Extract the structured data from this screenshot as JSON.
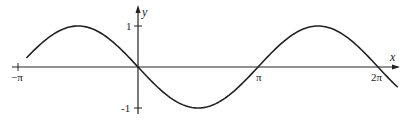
{
  "chart_data": {
    "type": "line",
    "title": "",
    "function": "y = -sin(x)",
    "xlabel": "x",
    "ylabel": "y",
    "x_ticks": [
      {
        "value": -3.14159,
        "label": "−π"
      },
      {
        "value": 3.14159,
        "label": "π"
      },
      {
        "value": 6.28319,
        "label": "2π"
      }
    ],
    "y_ticks": [
      {
        "value": 1,
        "label": "1"
      },
      {
        "value": -1,
        "label": "-1"
      }
    ],
    "xlim": [
      -2.92,
      6.8
    ],
    "ylim": [
      -1,
      1
    ],
    "grid": false,
    "legend": null,
    "series": [
      {
        "name": "-sin(x)",
        "x": [
          -2.92,
          -2.36,
          -1.57,
          -0.79,
          0,
          0.79,
          1.57,
          2.36,
          3.14,
          3.93,
          4.71,
          5.5,
          6.28,
          6.8
        ],
        "values": [
          0.22,
          0.71,
          1.0,
          0.71,
          0,
          -0.71,
          -1.0,
          -0.71,
          0,
          0.71,
          1.0,
          0.71,
          0,
          -0.49
        ]
      }
    ],
    "color": "#222222"
  },
  "labels": {
    "x_axis": "x",
    "y_axis": "y",
    "neg_pi": "−π",
    "pi": "π",
    "two_pi": "2π",
    "y_one": "1",
    "y_neg_one": "-1"
  }
}
